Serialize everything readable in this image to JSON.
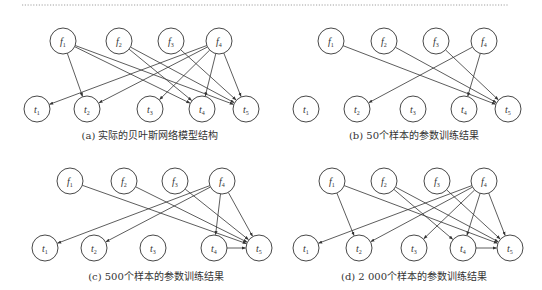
{
  "figure": {
    "nodes": {
      "top_row": [
        "f1",
        "f2",
        "f3",
        "f4"
      ],
      "bottom_row": [
        "t1",
        "t2",
        "t3",
        "t4",
        "t5"
      ]
    },
    "panels": [
      {
        "id": "a",
        "caption": "(a)  实际的贝叶斯网络模型结构",
        "edges": [
          [
            "f1",
            "t2"
          ],
          [
            "f1",
            "t4"
          ],
          [
            "f1",
            "t5"
          ],
          [
            "f2",
            "t4"
          ],
          [
            "f2",
            "t5"
          ],
          [
            "f3",
            "t5"
          ],
          [
            "f4",
            "t1"
          ],
          [
            "f4",
            "t2"
          ],
          [
            "f4",
            "t3"
          ],
          [
            "f4",
            "t4"
          ],
          [
            "f4",
            "t5"
          ]
        ]
      },
      {
        "id": "b",
        "caption": "(b)  50个样本的参数训练结果",
        "edges": [
          [
            "f1",
            "t5"
          ],
          [
            "f2",
            "t5"
          ],
          [
            "f3",
            "t5"
          ],
          [
            "f4",
            "t2"
          ],
          [
            "f4",
            "t4"
          ]
        ]
      },
      {
        "id": "c",
        "caption": "(c)  500个样本的参数训练结果",
        "edges": [
          [
            "f1",
            "t5"
          ],
          [
            "f2",
            "t5"
          ],
          [
            "f3",
            "t5"
          ],
          [
            "f4",
            "t1"
          ],
          [
            "f4",
            "t2"
          ],
          [
            "f4",
            "t4"
          ],
          [
            "f4",
            "t5"
          ],
          [
            "t4",
            "t5"
          ]
        ]
      },
      {
        "id": "d",
        "caption": "(d)  2 000个样本的参数训练结果",
        "edges": [
          [
            "f1",
            "t2"
          ],
          [
            "f1",
            "t5"
          ],
          [
            "f2",
            "t4"
          ],
          [
            "f2",
            "t5"
          ],
          [
            "f3",
            "t5"
          ],
          [
            "f4",
            "t1"
          ],
          [
            "f4",
            "t2"
          ],
          [
            "f4",
            "t3"
          ],
          [
            "f4",
            "t4"
          ],
          [
            "f4",
            "t5"
          ],
          [
            "t4",
            "t5"
          ]
        ]
      }
    ]
  }
}
